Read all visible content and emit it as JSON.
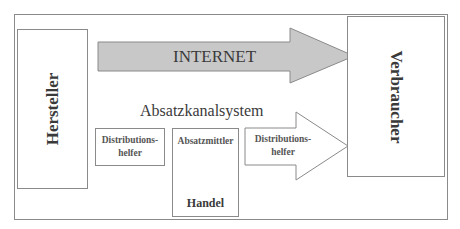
{
  "diagram": {
    "type": "flow",
    "colors": {
      "frame_border": "#8a8a8a",
      "internet_arrow_fill": "#c8c8c8",
      "channel_arrow_fill": "#ffffff",
      "text": "#3a3a3a"
    },
    "nodes": {
      "producer": {
        "label": "Hersteller"
      },
      "consumer": {
        "label": "Verbraucher"
      },
      "internet": {
        "label": "INTERNET"
      },
      "channel_system": {
        "label": "Absatzkanalsystem"
      },
      "distribution_helper_1": {
        "line1": "Distributions-",
        "line2": "helfer"
      },
      "intermediary": {
        "label": "Absatzmittler",
        "sublabel": "Handel"
      },
      "distribution_helper_2": {
        "line1": "Distributions-",
        "line2": "helfer"
      }
    },
    "edges": [
      {
        "from": "producer",
        "to": "consumer",
        "via": "internet"
      },
      {
        "from": "producer",
        "to": "consumer",
        "via": "channel_system"
      }
    ]
  }
}
